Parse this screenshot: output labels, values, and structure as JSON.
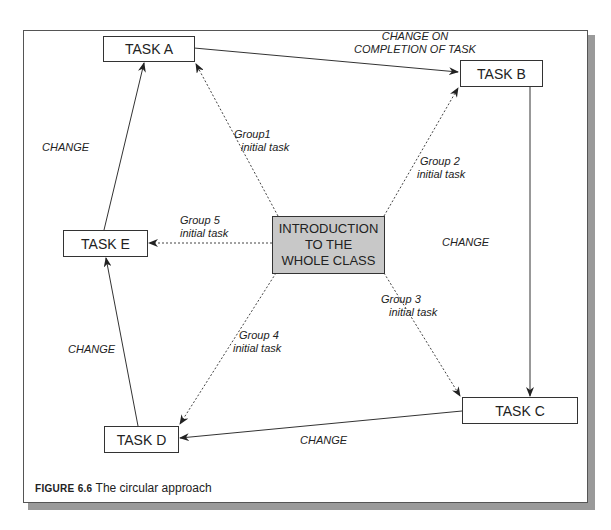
{
  "header_text": "approach to ... ",
  "tasks": {
    "a": "TASK A",
    "b": "TASK B",
    "c": "TASK C",
    "d": "TASK D",
    "e": "TASK E"
  },
  "center": {
    "line1": "INTRODUCTION",
    "line2": "TO THE",
    "line3": "WHOLE CLASS"
  },
  "labels": {
    "change_on_line1": "CHANGE ON",
    "change_on_line2": "COMPLETION OF TASK",
    "change_ea": "CHANGE",
    "change_bc": "CHANGE",
    "change_de": "CHANGE",
    "change_cd": "CHANGE",
    "group1_line1": "Group1",
    "group1_line2": "initial task",
    "group2_line1": "Group 2",
    "group2_line2": "initial task",
    "group3_line1": "Group 3",
    "group3_line2": "initial task",
    "group4_line1": "Group 4",
    "group4_line2": "initial task",
    "group5_line1": "Group 5",
    "group5_line2": "initial task"
  },
  "caption": {
    "figure_label": "FIGURE 6.6",
    "text": " The circular approach"
  }
}
